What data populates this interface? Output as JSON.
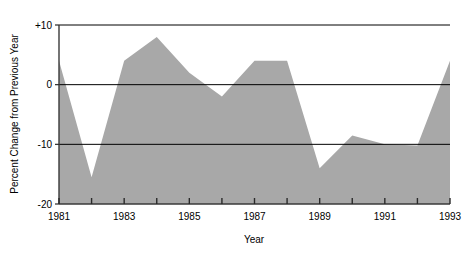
{
  "chart_data": {
    "type": "area",
    "title": "",
    "xlabel": "Year",
    "ylabel": "Percent Change from Previous Year",
    "x": [
      1981,
      1982,
      1983,
      1984,
      1985,
      1986,
      1987,
      1988,
      1989,
      1990,
      1991,
      1992,
      1993
    ],
    "values": [
      4,
      -15.5,
      4,
      8,
      2,
      -2,
      4,
      4,
      -14,
      -8.5,
      -10,
      -10.2,
      4
    ],
    "series": [
      {
        "name": "Percent Change from Previous Year",
        "values": [
          4,
          -15.5,
          4,
          8,
          2,
          -2,
          4,
          4,
          -14,
          -8.5,
          -10,
          -10.2,
          4
        ]
      }
    ],
    "xlim": [
      1981,
      1993
    ],
    "ylim": [
      -20,
      10
    ],
    "baseline": -20,
    "grid": true,
    "gridlines_y": [
      10,
      0,
      -10
    ],
    "legend": "none",
    "legend_position": "none",
    "fill_color": "#a8a8a8",
    "line_color": "#000000",
    "axis_color": "#3a3a3a",
    "background_color": "#ffffff",
    "x_ticks": [
      1981,
      1982,
      1983,
      1984,
      1985,
      1986,
      1987,
      1988,
      1989,
      1990,
      1991,
      1992,
      1993
    ],
    "x_tick_labels": [
      "1981",
      "",
      "1983",
      "",
      "1985",
      "",
      "1987",
      "",
      "1989",
      "",
      "1991",
      "",
      "1993"
    ],
    "y_ticks": [
      10,
      0,
      -10,
      -20
    ],
    "y_tick_labels": [
      "+10",
      "0",
      "-10",
      "-20"
    ]
  }
}
